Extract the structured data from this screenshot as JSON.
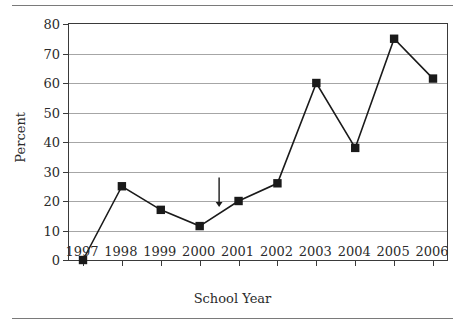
{
  "chart_data": {
    "type": "line",
    "title": "",
    "xlabel": "School Year",
    "ylabel": "Percent",
    "categories": [
      "1997",
      "1998",
      "1999",
      "2000",
      "2001",
      "2002",
      "2003",
      "2004",
      "2005",
      "2006"
    ],
    "values": [
      0,
      25,
      17,
      11.5,
      20,
      26,
      60,
      38,
      75,
      61.5
    ],
    "ylim": [
      0,
      80
    ],
    "yticks": [
      0,
      10,
      20,
      30,
      40,
      50,
      60,
      70,
      80
    ],
    "ytick_labels": [
      "0",
      "10",
      "20",
      "30",
      "40",
      "50",
      "60",
      "70",
      "80"
    ],
    "grid": true,
    "legend": "none",
    "series_color": "#1a1a1a",
    "marker": "square",
    "annotations": [
      {
        "type": "down-arrow",
        "x_position": "between 2000 and 2001",
        "x_value": 2000.5,
        "y_top": 28,
        "y_bottom": 18
      }
    ]
  },
  "figure": {
    "axis_line_color": "#3a3a3a",
    "gridline_color": "#a6a6a6",
    "rule_color": "#7a7a7a"
  }
}
